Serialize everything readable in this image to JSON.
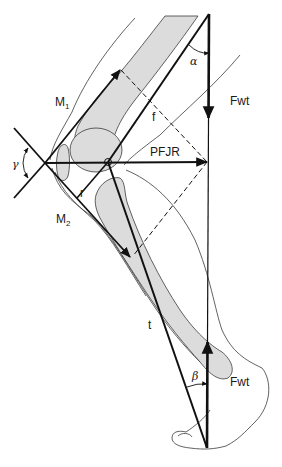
{
  "figure": {
    "labels": {
      "M1": {
        "base": "M",
        "sub": "1"
      },
      "M2": {
        "base": "M",
        "sub": "2"
      },
      "f": "f",
      "r": "r",
      "t": "t",
      "PFJR": "PFJR",
      "Fwt_top": "Fwt",
      "Fwt_bottom": "Fwt",
      "alpha": "α",
      "beta": "β",
      "gamma": "γ"
    },
    "colors": {
      "line": "#111111",
      "outline": "#3a3a3a",
      "bone_fill": "#dcdcdc",
      "background": "#ffffff"
    },
    "key_points": {
      "patella_crossing": [
        45,
        163
      ],
      "knee_pivot": [
        108,
        162
      ],
      "weight_line_top": [
        209,
        14
      ],
      "weight_line_bottom": [
        207,
        448
      ],
      "pfjr_head": [
        207,
        162
      ]
    }
  }
}
